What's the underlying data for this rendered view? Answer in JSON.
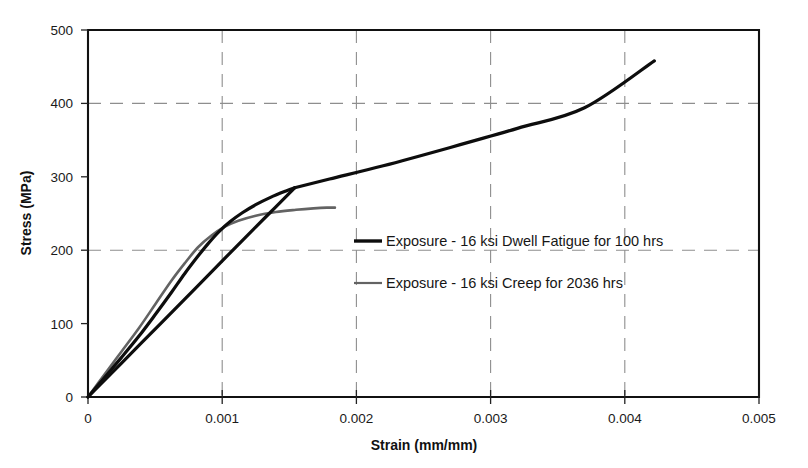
{
  "chart_data": {
    "type": "line",
    "title": "",
    "xlabel": "Strain (mm/mm)",
    "ylabel": "Stress (MPa)",
    "xlim": [
      0,
      0.005
    ],
    "ylim": [
      0,
      500
    ],
    "xticks": [
      "0",
      "0.001",
      "0.002",
      "0.003",
      "0.004",
      "0.005"
    ],
    "xtick_values": [
      0,
      0.001,
      0.002,
      0.003,
      0.004,
      0.005
    ],
    "yticks": [
      "0",
      "100",
      "200",
      "300",
      "400",
      "500"
    ],
    "ytick_values": [
      0,
      100,
      200,
      300,
      400,
      500
    ],
    "grid": "dashed gridlines at y=200,400 and x=0.001,0.002,0.003,0.004",
    "legend_position": "center-right inside plot",
    "series": [
      {
        "name": "Exposure - 16 ksi Dwell Fatigue for 100 hrs",
        "color": "#0d0d0d",
        "segments": [
          {
            "role": "initial-loading",
            "x": [
              0.0,
              0.00012,
              0.00025,
              0.00038,
              0.0005,
              0.00062,
              0.00072,
              0.00082,
              0.0009,
              0.00098,
              0.00106,
              0.00115,
              0.00125,
              0.00136,
              0.00148,
              0.00154
            ],
            "y": [
              0,
              26,
              54,
              83,
              112,
              142,
              168,
              192,
              210,
              226,
              239,
              251,
              262,
              272,
              281,
              285
            ]
          },
          {
            "role": "unload-reload-line",
            "x": [
              0.0,
              0.0004,
              0.0008,
              0.0011,
              0.00135,
              0.00154
            ],
            "y": [
              0,
              74,
              148,
              204,
              250,
              285
            ]
          },
          {
            "role": "post-yield-continuation",
            "x": [
              0.00154,
              0.0018,
              0.0022,
              0.0027,
              0.0032,
              0.0037,
              0.00422
            ],
            "y": [
              285,
              297,
              315,
              340,
              366,
              394,
              458
            ]
          }
        ]
      },
      {
        "name": "Exposure - 16 ksi Creep for 2036 hrs",
        "color": "#636363",
        "segments": [
          {
            "role": "loading-to-saturation",
            "x": [
              0.0,
              0.00012,
              0.00025,
              0.00038,
              0.0005,
              0.00062,
              0.00072,
              0.00082,
              0.00092,
              0.00102,
              0.00112,
              0.00125,
              0.0014,
              0.00155,
              0.00168,
              0.00178,
              0.00184
            ],
            "y": [
              0,
              30,
              62,
              94,
              126,
              158,
              182,
              204,
              220,
              232,
              240,
              247,
              252,
              255,
              257,
              258,
              258
            ]
          }
        ]
      }
    ]
  },
  "legend": {
    "items": [
      {
        "label": "Exposure - 16 ksi Dwell Fatigue for 100 hrs"
      },
      {
        "label": "Exposure - 16 ksi Creep for 2036 hrs"
      }
    ]
  },
  "axes": {
    "x_title": "Strain (mm/mm)",
    "y_title": "Stress (MPa)",
    "x_tick_labels": [
      "0",
      "0.001",
      "0.002",
      "0.003",
      "0.004",
      "0.005"
    ],
    "y_tick_labels": [
      "0",
      "100",
      "200",
      "300",
      "400",
      "500"
    ]
  },
  "colors": {
    "dwell_fatigue": "#0d0d0d",
    "creep": "#636363",
    "grid": "#8e8e8e",
    "frame": "#111111",
    "background": "#ffffff"
  }
}
